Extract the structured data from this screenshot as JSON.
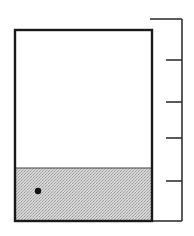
{
  "diagram": {
    "container": {
      "x": 15,
      "y": 30,
      "width": 137,
      "height": 191,
      "stroke": "#1a1a1a",
      "fill": "#ffffff"
    },
    "fill_region": {
      "top_y": 168,
      "bottom_y": 221,
      "color": "#cfcfcf",
      "pattern": "stipple"
    },
    "particle": {
      "cx": 38,
      "cy": 191,
      "r": 3.2,
      "color": "#111111"
    },
    "scale": {
      "x": 182,
      "top_y": 19,
      "bottom_y": 221,
      "top_cap_start_x": 150,
      "bottom_cap_start_x": 152,
      "stroke": "#333333",
      "ticks": [
        {
          "y": 60,
          "x1": 166
        },
        {
          "y": 102,
          "x1": 166
        },
        {
          "y": 138,
          "x1": 166
        },
        {
          "y": 181,
          "x1": 166
        }
      ]
    }
  }
}
